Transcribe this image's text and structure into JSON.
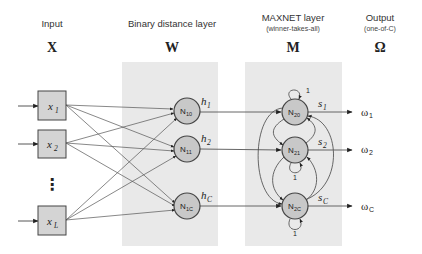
{
  "columns": {
    "input": {
      "title": "Input",
      "symbol": "X"
    },
    "distance": {
      "title": "Binary distance layer",
      "symbol": "W"
    },
    "maxnet": {
      "title": "MAXNET layer",
      "subtitle": "(winner-takes-all)",
      "symbol": "M"
    },
    "output": {
      "title": "Output",
      "subtitle": "(one-of-C)",
      "symbol": "Ω"
    }
  },
  "inputs": [
    {
      "base": "x",
      "sub": "1"
    },
    {
      "base": "x",
      "sub": "2"
    },
    {
      "base": "x",
      "sub": "L"
    }
  ],
  "ellipsis": "⋮",
  "layer1_nodes": [
    {
      "base": "N",
      "sub": "10",
      "out_base": "h",
      "out_sub": "1"
    },
    {
      "base": "N",
      "sub": "11",
      "out_base": "h",
      "out_sub": "2"
    },
    {
      "base": "N",
      "sub": "1C",
      "out_base": "h",
      "out_sub": "C"
    }
  ],
  "maxnet_nodes": [
    {
      "base": "N",
      "sub": "20",
      "out_base": "s",
      "out_sub": "1"
    },
    {
      "base": "N",
      "sub": "21",
      "out_base": "s",
      "out_sub": "2"
    },
    {
      "base": "N",
      "sub": "2C",
      "out_base": "s",
      "out_sub": "C"
    }
  ],
  "self_loop_weight": "1",
  "outputs": [
    {
      "base": "ω",
      "sub": "1"
    },
    {
      "base": "ω",
      "sub": "2"
    },
    {
      "base": "ω",
      "sub": "C"
    }
  ],
  "colors": {
    "panel": "#e9e9e9",
    "box_fill": "#d4d4d4",
    "node_fill": "#c8c8c8",
    "stroke": "#444444"
  }
}
